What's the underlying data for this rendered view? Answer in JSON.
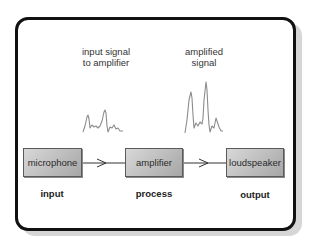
{
  "diagram": {
    "captions": {
      "input_signal": [
        "input signal",
        "to amplifier"
      ],
      "amplified_signal": [
        "amplified",
        "signal"
      ]
    },
    "blocks": [
      {
        "id": "microphone",
        "label": "microphone",
        "stage": "input"
      },
      {
        "id": "amplifier",
        "label": "amplifier",
        "stage": "process"
      },
      {
        "id": "loudspeaker",
        "label": "loudspeaker",
        "stage": "output"
      }
    ],
    "connections": [
      {
        "from": "microphone",
        "to": "amplifier"
      },
      {
        "from": "amplifier",
        "to": "loudspeaker"
      }
    ],
    "waveforms": [
      {
        "name": "input-signal-waveform",
        "description": "small amplitude signal"
      },
      {
        "name": "amplified-signal-waveform",
        "description": "large amplitude signal"
      }
    ],
    "colors": {
      "frame_border": "#111111",
      "frame_shadow": "#d6d6d6",
      "box_border": "#5a5a5a",
      "box_fill_light": "#d8d8d8",
      "box_fill_dark": "#a6a6a6",
      "waveform_stroke": "#8c8c8c",
      "connector": "#333333"
    }
  }
}
